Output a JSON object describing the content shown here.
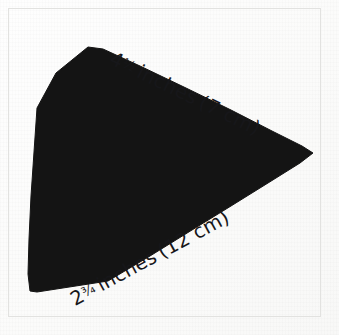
{
  "figure": {
    "kind": "geometry-illustration",
    "background_color": "#fdfdfc",
    "shape_color": "#141414",
    "frame_color": "#e2e2e0",
    "text_color": "#17171a"
  },
  "shape": {
    "name": "triangle",
    "fill": "#141414",
    "vertices": [
      {
        "label": "top",
        "x": 88,
        "y": 47
      },
      {
        "label": "right",
        "x": 313,
        "y": 153
      },
      {
        "label": "bottom-left",
        "x": 30,
        "y": 291
      }
    ],
    "outline_points": "88,47 103,49 140,66 186,88 231,110 272,131 302,146 313,153 300,163 268,183 231,206 192,230 150,256 108,281 37,292 30,291 28,274 29,239 31,196 34,152 37,108 56,73"
  },
  "labels": {
    "top_edge": {
      "full_text": "4½ inches (7 cm)",
      "whole": "4",
      "fraction": "½",
      "unit": "inches",
      "metric": "(7 cm)",
      "rotation_deg": 26
    },
    "bottom_edge": {
      "full_text": "2¾ inches (12 cm)",
      "whole": "2",
      "fraction": "¾",
      "unit": "inches",
      "metric": "(12 cm)",
      "rotation_deg": -28.5
    }
  },
  "measurements": {
    "top_side_inches": "4½",
    "top_side_cm": "7",
    "bottom_side_inches": "2¾",
    "bottom_side_cm": "12"
  }
}
